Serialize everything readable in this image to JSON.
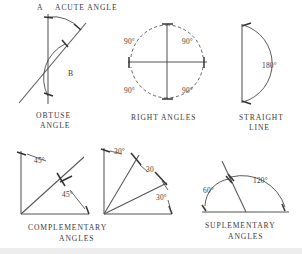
{
  "page": {
    "background": "#ffffff",
    "ink": "#4a4a4a"
  },
  "figures": [
    {
      "id": "obtuse-angle",
      "caption_line1": "OBTUSE",
      "caption_line2": "ANGLE",
      "labels": [
        {
          "name": "angle-a-label",
          "text": "A"
        },
        {
          "name": "angle-b-label",
          "text": "B"
        },
        {
          "name": "acute-angle-label",
          "text": "ACUTE  ANGLE"
        }
      ]
    },
    {
      "id": "right-angles",
      "caption_line1": "RIGHT  ANGLES",
      "caption_line2": "",
      "labels": [
        {
          "name": "quadrant-upper-left",
          "text": "90°"
        },
        {
          "name": "quadrant-upper-right",
          "text": "90°"
        },
        {
          "name": "quadrant-lower-left",
          "text": "90°"
        },
        {
          "name": "quadrant-lower-right",
          "text": "90°"
        }
      ]
    },
    {
      "id": "straight-line",
      "caption_line1": "STRAIGHT",
      "caption_line2": "LINE",
      "labels": [
        {
          "name": "straight-angle-value",
          "text": "180°"
        }
      ]
    },
    {
      "id": "complementary-angles",
      "caption_line1": "COMPLEMENTARY",
      "caption_line2": "ANGLES",
      "labels": [
        {
          "name": "upper-angle-value",
          "text": "45°"
        },
        {
          "name": "lower-angle-value",
          "text": "45°"
        }
      ]
    },
    {
      "id": "thirds-of-right-angle",
      "caption_line1": "",
      "caption_line2": "",
      "labels": [
        {
          "name": "first-third-value",
          "text": "30°"
        },
        {
          "name": "second-third-value",
          "text": "30"
        },
        {
          "name": "third-third-value",
          "text": "30°"
        }
      ]
    },
    {
      "id": "supplementary-angles",
      "caption_line1": "SUPLEMENTARY",
      "caption_line2": "ANGLES",
      "labels": [
        {
          "name": "left-angle-value",
          "text": "60°"
        },
        {
          "name": "right-angle-value",
          "text": "120°"
        }
      ]
    }
  ]
}
